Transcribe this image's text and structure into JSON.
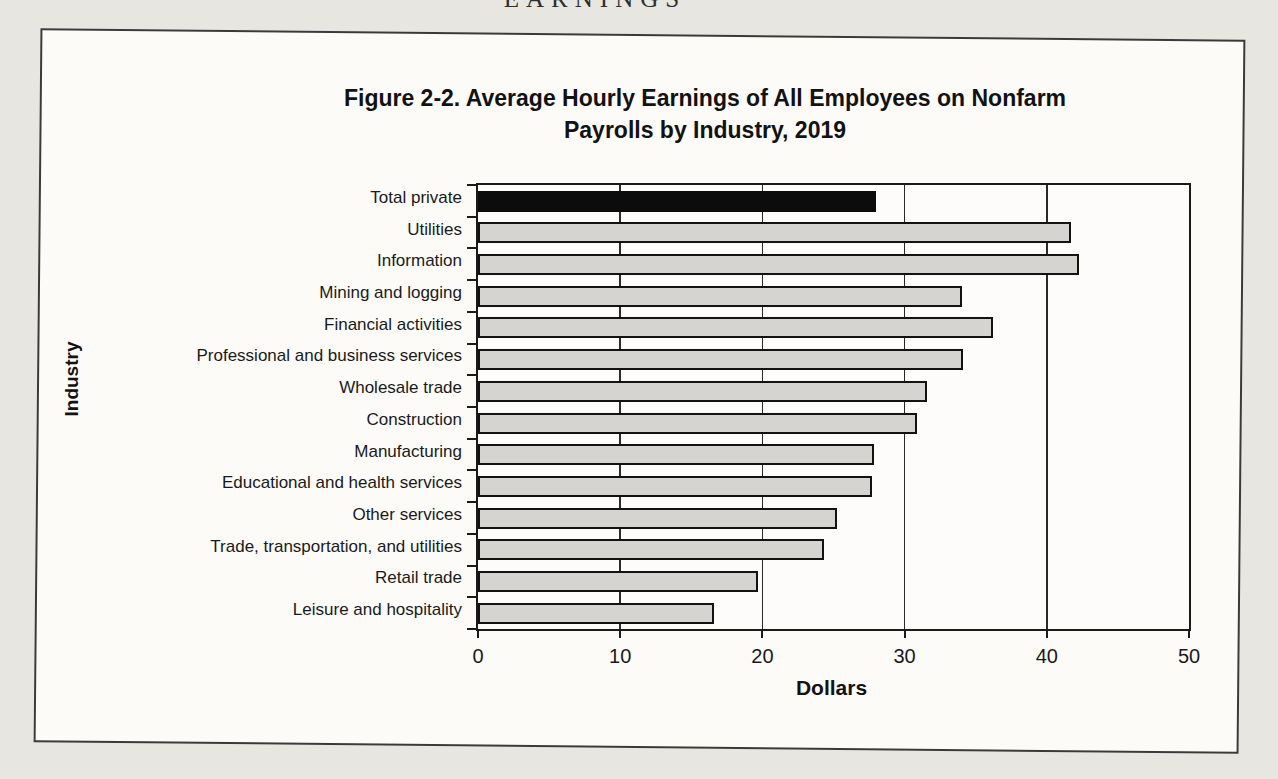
{
  "page": {
    "header_text": "EARNINGS"
  },
  "chart_data": {
    "type": "bar",
    "orientation": "horizontal",
    "title": "Figure 2-2. Average Hourly Earnings of All Employees on Nonfarm Payrolls by Industry, 2019",
    "title_lines": [
      "Figure 2-2. Average Hourly Earnings of All Employees on Nonfarm",
      "Payrolls by Industry, 2019"
    ],
    "categories": [
      "Total private",
      "Utilities",
      "Information",
      "Mining and logging",
      "Financial activities",
      "Professional and business services",
      "Wholesale trade",
      "Construction",
      "Manufacturing",
      "Educational and health services",
      "Other services",
      "Trade, transportation, and utilities",
      "Retail trade",
      "Leisure and hospitality"
    ],
    "values": [
      27.99,
      41.71,
      42.29,
      34.07,
      36.21,
      34.1,
      31.61,
      30.86,
      27.88,
      27.7,
      25.26,
      24.31,
      19.72,
      16.61
    ],
    "xlabel": "Dollars",
    "ylabel": "Industry",
    "xlim": [
      0,
      50
    ],
    "xticks": [
      0,
      10,
      20,
      30,
      40,
      50
    ],
    "grid": "vertical gridlines every 10, black",
    "legend": "none",
    "bar_style": {
      "default_fill": "#d5d4d1",
      "border": "#121212",
      "highlight_index": 0,
      "highlight_fill": "#0c0c0c"
    }
  }
}
